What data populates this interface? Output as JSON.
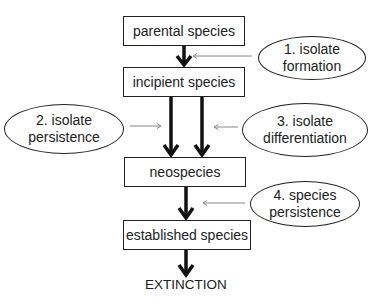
{
  "diagram": {
    "boxes": {
      "parental": "parental species",
      "incipient": "incipient species",
      "neospecies": "neospecies",
      "established": "established species"
    },
    "terminal": "EXTINCTION",
    "stages": [
      {
        "line1": "1. isolate",
        "line2": "formation"
      },
      {
        "line1": "2. isolate",
        "line2": "persistence"
      },
      {
        "line1": "3. isolate",
        "line2": "differentiation"
      },
      {
        "line1": "4. species",
        "line2": "persistence"
      }
    ],
    "colors": {
      "stroke": "#111111",
      "thin_arrow": "#888888",
      "background": "#ffffff"
    }
  }
}
